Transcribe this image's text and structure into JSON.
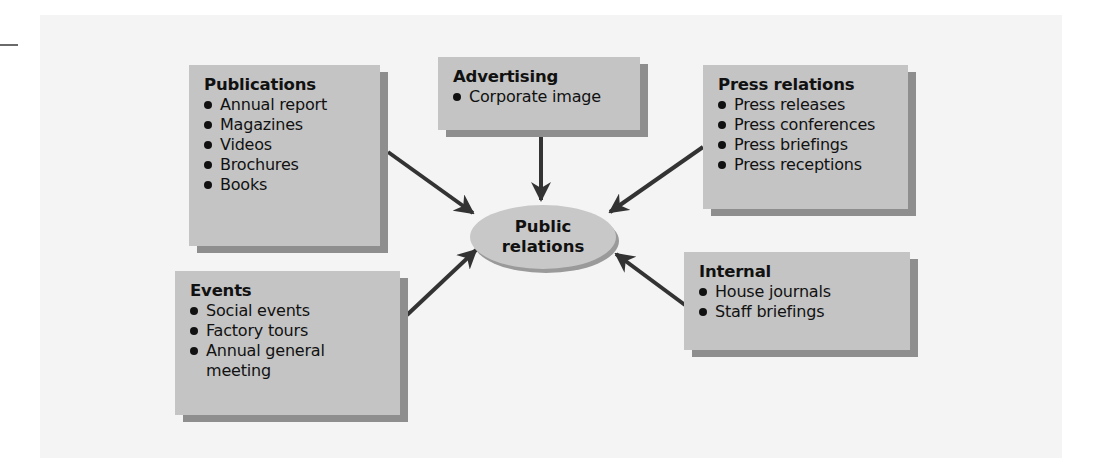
{
  "diagram": {
    "center": {
      "line1": "Public",
      "line2": "relations"
    },
    "boxes": {
      "publications": {
        "title": "Publications",
        "items": [
          "Annual report",
          "Magazines",
          "Videos",
          "Brochures",
          "Books"
        ]
      },
      "advertising": {
        "title": "Advertising",
        "items": [
          "Corporate image"
        ]
      },
      "press": {
        "title": "Press relations",
        "items": [
          "Press releases",
          "Press conferences",
          "Press briefings",
          "Press receptions"
        ]
      },
      "events": {
        "title": "Events",
        "items": [
          "Social events",
          "Factory tours",
          "Annual general",
          "meeting"
        ]
      },
      "internal": {
        "title": "Internal",
        "items": [
          "House journals",
          "Staff briefings"
        ]
      }
    },
    "colors": {
      "box_fill": "#c4c4c4",
      "box_shadow": "#8e8e8e",
      "arrow": "#333333",
      "panel": "#f4f4f4"
    }
  }
}
